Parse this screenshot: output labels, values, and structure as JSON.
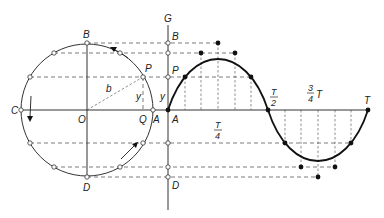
{
  "diagram": {
    "type": "circle-to-sine-wave-construction",
    "labels": {
      "G": "G",
      "B_circle": "B",
      "B_axis": "B",
      "P_circle": "P",
      "P_axis": "P",
      "C": "C",
      "O": "O",
      "Q": "Q",
      "A_circle": "A",
      "A_axis": "A",
      "D_circle": "D",
      "D_axis": "D",
      "b": "b",
      "y_circle": "y",
      "y_axis": "y",
      "T": "T",
      "T_half_num": "T",
      "T_half_den": "2",
      "T_quarter_num": "T",
      "T_quarter_den": "4",
      "three_quarter_num": "3",
      "three_quarter_den": "4",
      "three_quarter_T": "T"
    },
    "colors": {
      "line": "#333333",
      "curve": "#111111",
      "background": "#ffffff"
    }
  }
}
